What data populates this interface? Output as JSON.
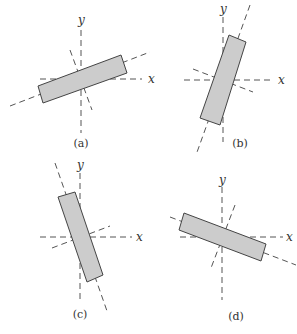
{
  "figure": {
    "panels": [
      {
        "id": "a",
        "caption": "(a)",
        "x_label": "x",
        "y_label": "y",
        "origin": [
          81,
          79
        ],
        "x_axis": [
          [
            40,
            79
          ],
          [
            142,
            79
          ]
        ],
        "y_axis": [
          [
            81,
            30
          ],
          [
            81,
            133
          ]
        ],
        "principal_axis_1": [
          [
            10,
            106
          ],
          [
            150,
            52
          ]
        ],
        "principal_axis_2": [
          [
            70,
            50
          ],
          [
            92,
            110
          ]
        ],
        "rect": [
          [
            38,
            86
          ],
          [
            121,
            55
          ],
          [
            127,
            73
          ],
          [
            43,
            103
          ]
        ],
        "x_label_pos": [
          148,
          83
        ],
        "y_label_pos": [
          78,
          24
        ],
        "caption_pos": [
          81,
          147
        ]
      },
      {
        "id": "b",
        "caption": "(b)",
        "x_label": "x",
        "y_label": "y",
        "origin": [
          223,
          80
        ],
        "x_axis": [
          [
            184,
            80
          ],
          [
            274,
            80
          ]
        ],
        "y_axis": [
          [
            223,
            17
          ],
          [
            223,
            142
          ]
        ],
        "principal_axis_1": [
          [
            250,
            5
          ],
          [
            196,
            155
          ]
        ],
        "principal_axis_2": [
          [
            193,
            69
          ],
          [
            253,
            92
          ]
        ],
        "rect": [
          [
            229,
            35
          ],
          [
            246,
            42
          ],
          [
            220,
            125
          ],
          [
            200,
            118
          ]
        ],
        "x_label_pos": [
          278,
          84
        ],
        "y_label_pos": [
          220,
          13
        ],
        "caption_pos": [
          240,
          147
        ]
      },
      {
        "id": "c",
        "caption": "(c)",
        "x_label": "x",
        "y_label": "y",
        "origin": [
          80,
          237
        ],
        "x_axis": [
          [
            40,
            237
          ],
          [
            132,
            237
          ]
        ],
        "y_axis": [
          [
            80,
            173
          ],
          [
            80,
            300
          ]
        ],
        "principal_axis_1": [
          [
            55,
            163
          ],
          [
            107,
            311
          ]
        ],
        "principal_axis_2": [
          [
            52,
            248
          ],
          [
            110,
            226
          ]
        ],
        "rect": [
          [
            58,
            197
          ],
          [
            75,
            192
          ],
          [
            103,
            275
          ],
          [
            87,
            282
          ]
        ],
        "x_label_pos": [
          136,
          241
        ],
        "y_label_pos": [
          77,
          169
        ],
        "caption_pos": [
          80,
          318
        ]
      },
      {
        "id": "d",
        "caption": "(d)",
        "x_label": "x",
        "y_label": "y",
        "origin": [
          222,
          237
        ],
        "x_axis": [
          [
            180,
            237
          ],
          [
            283,
            237
          ]
        ],
        "y_axis": [
          [
            222,
            187
          ],
          [
            222,
            300
          ]
        ],
        "principal_axis_1": [
          [
            170,
            217
          ],
          [
            296,
            265
          ]
        ],
        "principal_axis_2": [
          [
            235,
            205
          ],
          [
            211,
            268
          ]
        ],
        "rect": [
          [
            184,
            213
          ],
          [
            266,
            244
          ],
          [
            261,
            261
          ],
          [
            179,
            230
          ]
        ],
        "x_label_pos": [
          286,
          241
        ],
        "y_label_pos": [
          219,
          184
        ],
        "caption_pos": [
          236,
          320
        ]
      }
    ],
    "colors": {
      "rect_fill": "#cccccc",
      "rect_stroke": "#444444",
      "axis": "#555555",
      "text": "#333333"
    }
  }
}
